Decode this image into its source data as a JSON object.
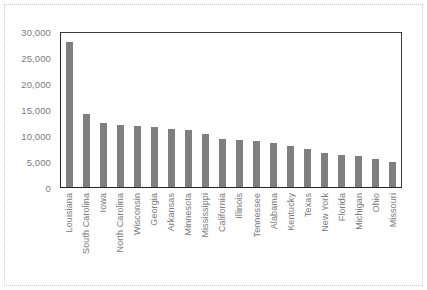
{
  "chart_data": {
    "type": "bar",
    "title": "",
    "subtitle": "",
    "xlabel": "",
    "ylabel": "",
    "ylim": [
      0,
      30000
    ],
    "grid": false,
    "legend": false,
    "bar_color": "#7f7f7f",
    "axis_color": "#262626",
    "tick_label_color": "#7a7a7a",
    "y_ticks": [
      "0",
      "5,000",
      "10,000",
      "15,000",
      "20,000",
      "25,000",
      "30,000"
    ],
    "y_tick_values": [
      0,
      5000,
      10000,
      15000,
      20000,
      25000,
      30000
    ],
    "categories": [
      "Louisiana",
      "South Carolina",
      "Iowa",
      "North Carolina",
      "Wisconsin",
      "Georgia",
      "Arkansas",
      "Minnesota",
      "Mississippi",
      "California",
      "Illinois",
      "Tennessee",
      "Alabama",
      "Kentucky",
      "Texas",
      "New York",
      "Florida",
      "Michigan",
      "Ohio",
      "Missouri"
    ],
    "values": [
      27800,
      14000,
      12400,
      12000,
      11800,
      11600,
      11200,
      10900,
      10100,
      9200,
      9100,
      8800,
      8500,
      7900,
      7300,
      6500,
      6200,
      5900,
      5300,
      4800
    ]
  }
}
